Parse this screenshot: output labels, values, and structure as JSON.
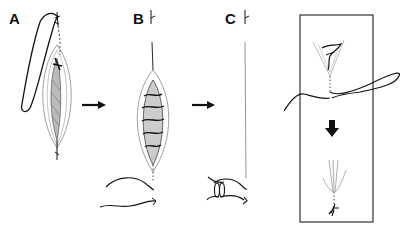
{
  "figure": {
    "panels": [
      {
        "id": "A",
        "label": "A",
        "description": "Open wound with needle and suture loop passing through top apex"
      },
      {
        "id": "B",
        "label": "B",
        "description": "Continuous running suture through wound; free suture ends below"
      },
      {
        "id": "C",
        "label": "C",
        "description": "Closed wound line with tied knot below"
      },
      {
        "id": "inset",
        "label": "",
        "description": "Boxed inset: apex stitch with suture, down arrow, tied result"
      }
    ],
    "arrows": [
      {
        "from": "A",
        "to": "B",
        "direction": "right"
      },
      {
        "from": "B",
        "to": "C",
        "direction": "right"
      },
      {
        "from": "inset-top",
        "to": "inset-bottom",
        "direction": "down"
      }
    ],
    "colors": {
      "ink": "#111111",
      "light_ink": "#999999",
      "background": "#ffffff"
    }
  }
}
